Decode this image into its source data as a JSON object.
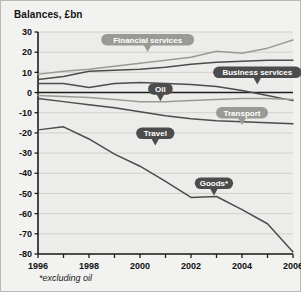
{
  "figure": {
    "title": "Balances, £bn",
    "footnote": "*excluding oil",
    "background_color": "#f2f2f0",
    "plot_background_color": "#ececeb",
    "border_color": "#b9b9b4"
  },
  "chart_data": {
    "type": "line",
    "title": "Balances, £bn",
    "xlabel": "",
    "ylabel": "Balances, £bn",
    "xlim": [
      1996,
      2006
    ],
    "ylim": [
      -80,
      30
    ],
    "grid": true,
    "legend_position": "inline-callouts",
    "annotations": [
      "*excluding oil"
    ],
    "x": [
      1996,
      1997,
      1998,
      1999,
      2000,
      2001,
      2002,
      2003,
      2004,
      2005,
      2006
    ],
    "xticks": [
      1996,
      1997,
      1998,
      1999,
      2000,
      2001,
      2002,
      2003,
      2004,
      2005,
      2006
    ],
    "xticklabels": [
      "1996",
      "",
      "1998",
      "",
      "2000",
      "",
      "2002",
      "",
      "2004",
      "",
      "2006"
    ],
    "yticks": [
      30,
      20,
      10,
      0,
      -10,
      -20,
      -30,
      -40,
      -50,
      -60,
      -70,
      -80
    ],
    "yticklabels": [
      "30",
      "20",
      "10",
      "0",
      "-10",
      "-20",
      "-30",
      "-40",
      "-50",
      "-60",
      "-70",
      "-80"
    ],
    "series": [
      {
        "name": "Financial services",
        "color": "#9a9a95",
        "label_style": "light",
        "values": [
          9,
          10.5,
          11.5,
          13,
          14.5,
          16,
          17.5,
          20.5,
          19.5,
          22,
          26
        ]
      },
      {
        "name": "Business services",
        "color": "#4c4c4c",
        "label_style": "dark",
        "values": [
          6.5,
          8,
          10.5,
          11,
          11.5,
          12.5,
          14,
          15,
          15.5,
          16,
          16
        ]
      },
      {
        "name": "Oil",
        "color": "#4c4c4c",
        "label_style": "dark",
        "values": [
          4.5,
          4.5,
          2.5,
          4.5,
          5,
          4.5,
          4,
          3,
          1,
          -1.5,
          -4
        ]
      },
      {
        "name": "Transport",
        "color": "#9a9a95",
        "label_style": "light",
        "values": [
          -1.5,
          -2,
          -2.5,
          -3.5,
          -4.5,
          -4.5,
          -4,
          -3.5,
          -3,
          -3,
          -3.5
        ]
      },
      {
        "name": "Travel",
        "color": "#4c4c4c",
        "label_style": "dark",
        "values": [
          -3,
          -4.5,
          -6,
          -7.5,
          -9.5,
          -11.5,
          -13,
          -14,
          -14.5,
          -15,
          -15.5
        ]
      },
      {
        "name": "Goods*",
        "color": "#4c4c4c",
        "label_style": "dark",
        "values": [
          -18.5,
          -17,
          -23,
          -30.5,
          -36.5,
          -44,
          -52,
          -51.5,
          -58,
          -65,
          -79
        ]
      }
    ],
    "callouts": [
      {
        "text": "Financial services",
        "style": "light",
        "x": 2000.3,
        "y": 26.2,
        "anchor_series": "Financial services"
      },
      {
        "text": "Business services",
        "style": "dark",
        "x": 2004.6,
        "y": 10.0,
        "anchor_series": "Business services"
      },
      {
        "text": "Oil",
        "style": "dark",
        "x": 2000.8,
        "y": 1.8,
        "anchor_series": "Oil"
      },
      {
        "text": "Transport",
        "style": "light",
        "x": 2004.0,
        "y": -10.0,
        "anchor_series": "Transport"
      },
      {
        "text": "Travel",
        "style": "dark",
        "x": 2000.6,
        "y": -20.2,
        "anchor_series": "Travel"
      },
      {
        "text": "Goods*",
        "style": "dark",
        "x": 2002.9,
        "y": -45.0,
        "anchor_series": "Goods*"
      }
    ]
  }
}
